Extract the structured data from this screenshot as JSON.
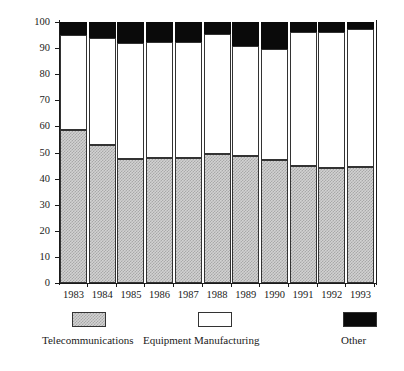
{
  "chart_data": {
    "type": "bar",
    "subtype": "stacked-bar-100-percent",
    "title": "",
    "xlabel": "",
    "ylabel": "Revenue in %",
    "ylim": [
      0,
      100
    ],
    "yticks": [
      0,
      10,
      20,
      30,
      40,
      50,
      60,
      70,
      80,
      90,
      100
    ],
    "ytick_labels": [
      "0",
      "10",
      "20",
      "30",
      "40",
      "50",
      "60",
      "70",
      "80",
      "90",
      "100"
    ],
    "grid": false,
    "legend_position": "bottom",
    "categories": [
      "1983",
      "1984",
      "1985",
      "1986",
      "1987",
      "1988",
      "1989",
      "1990",
      "1991",
      "1992",
      "1993"
    ],
    "series": [
      {
        "name": "Telecommunications",
        "color": "#d2d2d2",
        "pattern": "dotted-hatch",
        "values": [
          58.5,
          53,
          47.5,
          48,
          48,
          49.5,
          48.5,
          47,
          45,
          44,
          44.5
        ]
      },
      {
        "name": "Equipment Manufacturing",
        "color": "#ffffff",
        "pattern": "solid",
        "values": [
          36.5,
          41,
          44.5,
          44.5,
          44.5,
          46,
          42.5,
          42.5,
          51,
          52,
          53
        ]
      },
      {
        "name": "Other",
        "color": "#000000",
        "pattern": "solid",
        "values": [
          5,
          6,
          8,
          7.5,
          7.5,
          4.5,
          9,
          10.5,
          4,
          4,
          2.5
        ]
      }
    ],
    "cumulative_tops": {
      "telecom": [
        58.5,
        53,
        47.5,
        48,
        48,
        49.5,
        48.5,
        47,
        45,
        44,
        44.5
      ],
      "telecom_plus_equipment": [
        95,
        94,
        92,
        92.5,
        92.5,
        95.5,
        91,
        89.5,
        96,
        96,
        97.5
      ],
      "total": [
        100,
        100,
        100,
        100,
        100,
        100,
        100,
        100,
        100,
        100,
        100
      ]
    }
  },
  "legend": {
    "items": [
      {
        "label": "Telecommunications"
      },
      {
        "label": "Equipment Manufacturing"
      },
      {
        "label": "Other"
      }
    ]
  },
  "axes": {
    "y_title": "Revenue in %"
  }
}
